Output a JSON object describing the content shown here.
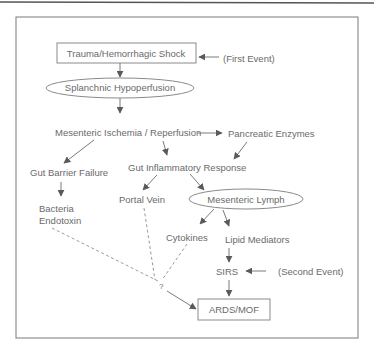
{
  "diagram": {
    "title_rule": true,
    "nodes": {
      "trauma": {
        "label": "Trauma/Hemorrhagic Shock",
        "shape": "rectangle"
      },
      "first_event": {
        "label": "(First Event)"
      },
      "splanchnic": {
        "label": "Splanchnic Hypoperfusion",
        "shape": "ellipse"
      },
      "ischemia": {
        "label": "Mesenteric Ischemia / Reperfusion"
      },
      "pancreatic": {
        "label": "Pancreatic Enzymes"
      },
      "gut_barrier": {
        "label": "Gut Barrier Failure"
      },
      "gut_inflammatory": {
        "label": "Gut Inflammatory Response"
      },
      "bacteria": {
        "label_line1": "Bacteria",
        "label_line2": "Endotoxin"
      },
      "portal_vein": {
        "label": "Portal Vein"
      },
      "mesenteric_lymph": {
        "label": "Mesenteric Lymph",
        "shape": "ellipse"
      },
      "cytokines": {
        "label": "Cytokines"
      },
      "lipid_mediators": {
        "label": "Lipid Mediators"
      },
      "sirs": {
        "label": "SIRS"
      },
      "second_event": {
        "label": "(Second Event)"
      },
      "question": {
        "label": "?"
      },
      "ards_mof": {
        "label": "ARDS/MOF",
        "shape": "rectangle"
      }
    },
    "edges": [
      {
        "from": "first_event",
        "to": "trauma",
        "style": "solid"
      },
      {
        "from": "trauma",
        "to": "splanchnic",
        "style": "solid"
      },
      {
        "from": "splanchnic",
        "to": "ischemia",
        "style": "solid"
      },
      {
        "from": "ischemia",
        "to": "pancreatic",
        "style": "solid"
      },
      {
        "from": "ischemia",
        "to": "gut_barrier",
        "style": "solid"
      },
      {
        "from": "ischemia",
        "to": "gut_inflammatory",
        "style": "solid"
      },
      {
        "from": "pancreatic",
        "to": "gut_inflammatory",
        "style": "solid"
      },
      {
        "from": "gut_barrier",
        "to": "bacteria",
        "style": "solid"
      },
      {
        "from": "gut_inflammatory",
        "to": "portal_vein",
        "style": "solid"
      },
      {
        "from": "gut_inflammatory",
        "to": "mesenteric_lymph",
        "style": "solid"
      },
      {
        "from": "mesenteric_lymph",
        "to": "cytokines",
        "style": "solid"
      },
      {
        "from": "mesenteric_lymph",
        "to": "lipid_mediators",
        "style": "solid"
      },
      {
        "from": "lipid_mediators",
        "to": "sirs",
        "style": "solid"
      },
      {
        "from": "second_event",
        "to": "sirs",
        "style": "solid"
      },
      {
        "from": "sirs",
        "to": "ards_mof",
        "style": "solid"
      },
      {
        "from": "bacteria",
        "to": "question",
        "style": "dashed"
      },
      {
        "from": "portal_vein",
        "to": "question",
        "style": "dashed"
      },
      {
        "from": "cytokines",
        "to": "question",
        "style": "dashed"
      },
      {
        "from": "question",
        "to": "ards_mof",
        "style": "solid"
      }
    ],
    "colors": {
      "text": "#6a6a6a",
      "line": "#7a7a7a",
      "background": "#ffffff"
    }
  }
}
